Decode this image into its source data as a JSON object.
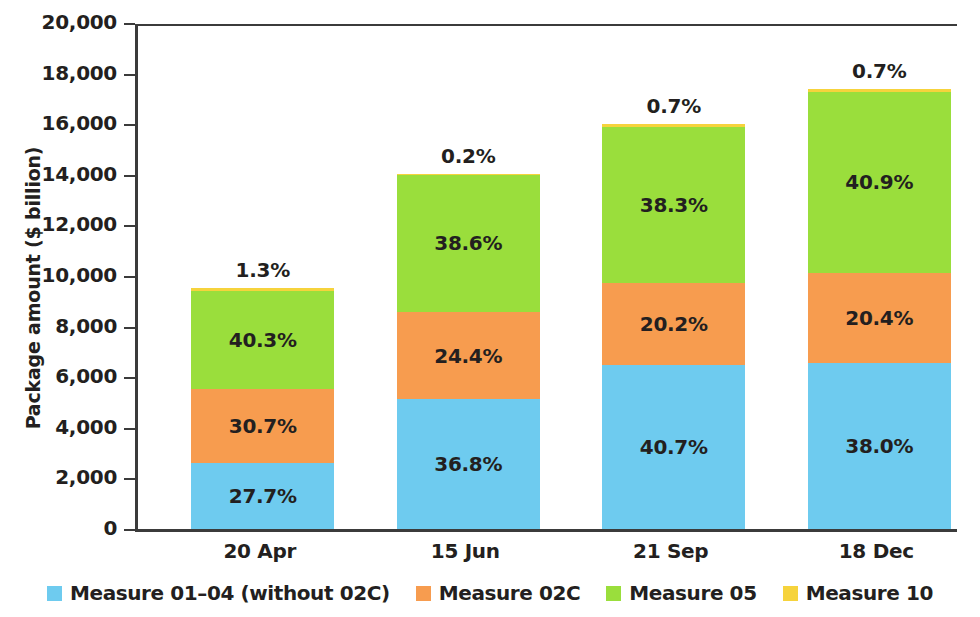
{
  "chart_data": {
    "type": "bar",
    "subtype": "stacked",
    "title": "",
    "xlabel": "",
    "ylabel": "Package amount ($ billion)",
    "categories": [
      "20 Apr",
      "15 Jun",
      "21 Sep",
      "18 Dec"
    ],
    "ylim": [
      0,
      20000
    ],
    "ytick_values": [
      0,
      2000,
      4000,
      6000,
      8000,
      10000,
      12000,
      14000,
      16000,
      18000,
      20000
    ],
    "ytick_labels": [
      "0",
      "2,000",
      "4,000",
      "6,000",
      "8,000",
      "10,000",
      "12,000",
      "14,000",
      "16,000",
      "18,000",
      "20,000"
    ],
    "grid": false,
    "legend_position": "bottom",
    "totals": [
      9560,
      14070,
      16050,
      17430
    ],
    "series": [
      {
        "name": "Measure 01–04 (without 02C)",
        "color": "#6ecbef",
        "values": [
          2650,
          5180,
          6530,
          6620
        ],
        "percent_labels": [
          "27.7%",
          "36.8%",
          "40.7%",
          "38.0%"
        ]
      },
      {
        "name": "Measure 02C",
        "color": "#f79c4f",
        "values": [
          2935,
          3433,
          3242,
          3556
        ],
        "percent_labels": [
          "30.7%",
          "24.4%",
          "20.2%",
          "20.4%"
        ]
      },
      {
        "name": "Measure 05",
        "color": "#9ade3c",
        "values": [
          3853,
          5431,
          6147,
          7129
        ],
        "percent_labels": [
          "40.3%",
          "38.6%",
          "38.3%",
          "40.9%"
        ]
      },
      {
        "name": "Measure 10",
        "color": "#f6d33c",
        "values": [
          124,
          28,
          112,
          122
        ],
        "percent_labels": [
          "1.3%",
          "0.2%",
          "0.7%",
          "0.7%"
        ]
      }
    ]
  },
  "axis": {
    "y_title": "Package amount ($ billion)"
  },
  "legend": {
    "items": [
      {
        "label": "Measure 01–04 (without 02C)",
        "color": "#6ecbef"
      },
      {
        "label": "Measure 02C",
        "color": "#f79c4f"
      },
      {
        "label": "Measure 05",
        "color": "#9ade3c"
      },
      {
        "label": "Measure 10",
        "color": "#f6d33c"
      }
    ]
  }
}
